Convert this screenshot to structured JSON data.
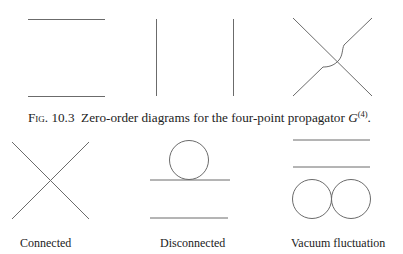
{
  "caption": {
    "fig_number": "Fig. 10.3",
    "text": "Zero-order diagrams for the four-point propagator ",
    "symbol": "G",
    "superscript": "(4)",
    "end": "."
  },
  "top_row": {
    "diagrams": [
      {
        "name": "two horizontal propagators"
      },
      {
        "name": "two vertical propagators"
      },
      {
        "name": "crossed propagators with bypass"
      }
    ]
  },
  "bottom_row": {
    "labels": [
      "Connected",
      "Disconnected",
      "Vacuum fluctuation"
    ]
  },
  "colors": {
    "line": "#6b6b6b",
    "text": "#222222"
  }
}
